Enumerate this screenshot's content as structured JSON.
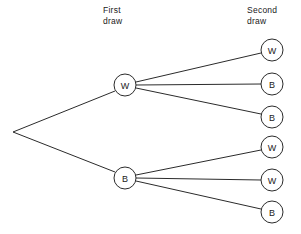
{
  "diagram": {
    "type": "probability-tree",
    "title": "",
    "headings": {
      "first_draw": "First\ndraw",
      "second_draw": "Second\ndraw"
    },
    "root": {
      "label": "",
      "x": 13,
      "y": 132,
      "has_circle": false
    },
    "first_draw_nodes": [
      {
        "label": "W",
        "x": 125,
        "y": 85,
        "r": 11
      },
      {
        "label": "B",
        "x": 125,
        "y": 178,
        "r": 11
      }
    ],
    "second_draw_nodes": [
      {
        "label": "W",
        "x": 272,
        "y": 50,
        "r": 11,
        "parent": 0
      },
      {
        "label": "B",
        "x": 272,
        "y": 84,
        "r": 11,
        "parent": 0
      },
      {
        "label": "B",
        "x": 272,
        "y": 117,
        "r": 11,
        "parent": 0
      },
      {
        "label": "W",
        "x": 272,
        "y": 147,
        "r": 11,
        "parent": 1
      },
      {
        "label": "W",
        "x": 272,
        "y": 180,
        "r": 11,
        "parent": 1
      },
      {
        "label": "B",
        "x": 272,
        "y": 212,
        "r": 11,
        "parent": 1
      }
    ],
    "edges": [
      {
        "from": "root",
        "to": "first-0",
        "x1": 13,
        "y1": 132,
        "x2": 115,
        "y2": 91
      },
      {
        "from": "root",
        "to": "first-1",
        "x1": 13,
        "y1": 132,
        "x2": 115,
        "y2": 172
      },
      {
        "from": "first-0",
        "to": "second-0",
        "x1": 136,
        "y1": 82,
        "x2": 261,
        "y2": 53
      },
      {
        "from": "first-0",
        "to": "second-1",
        "x1": 136,
        "y1": 85,
        "x2": 261,
        "y2": 84
      },
      {
        "from": "first-0",
        "to": "second-2",
        "x1": 136,
        "y1": 88,
        "x2": 261,
        "y2": 114
      },
      {
        "from": "first-1",
        "to": "second-3",
        "x1": 136,
        "y1": 175,
        "x2": 261,
        "y2": 150
      },
      {
        "from": "first-1",
        "to": "second-4",
        "x1": 136,
        "y1": 178,
        "x2": 261,
        "y2": 180
      },
      {
        "from": "first-1",
        "to": "second-5",
        "x1": 136,
        "y1": 181,
        "x2": 261,
        "y2": 209
      }
    ],
    "colors": {
      "stroke": "#2b2b2b",
      "fill": "#ffffff",
      "text": "#1a1a1a",
      "background": "#ffffff"
    }
  }
}
